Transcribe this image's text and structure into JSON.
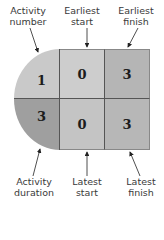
{
  "labels": {
    "activity_number": [
      "Activity",
      "number"
    ],
    "earliest_start": [
      "Earliest",
      "start"
    ],
    "earliest_finish": [
      "Earliest",
      "finish"
    ],
    "activity_duration": [
      "Activity",
      "duration"
    ],
    "latest_start": [
      "Latest",
      "start"
    ],
    "latest_finish": [
      "Latest",
      "finish"
    ]
  },
  "node": {
    "activity_number": "1",
    "earliest_start": "0",
    "earliest_finish": "3",
    "activity_duration": "3",
    "latest_start": "0",
    "latest_finish": "3"
  },
  "colors": {
    "activity_number": "#c9c9c9",
    "earliest_start": "#cdcdcd",
    "earliest_finish": "#b5b5b5",
    "activity_duration": "#9f9f9f",
    "latest_start": "#c4c4c4",
    "latest_finish": "#b7b7b7",
    "border": "#555555"
  }
}
